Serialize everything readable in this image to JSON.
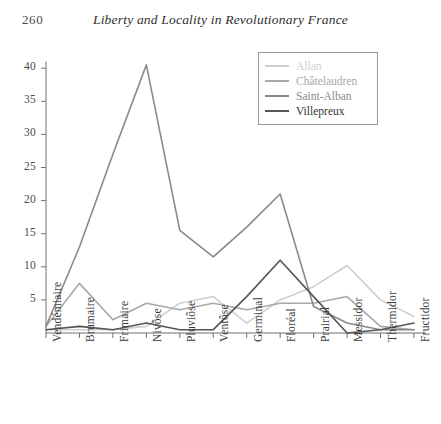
{
  "header": {
    "page_number": "260",
    "title": "Liberty and Locality in Revolutionary France"
  },
  "chart_data": {
    "type": "line",
    "title": "",
    "xlabel": "",
    "ylabel": "",
    "grid": false,
    "legend_position": "top-right",
    "categories": [
      "Vendémiaire",
      "Brumaire",
      "Frimaire",
      "Nivôse",
      "Pluviôse",
      "Ventôse",
      "Germinal",
      "Floréal",
      "Prairial",
      "Messidor",
      "Thermidor",
      "Fructidor"
    ],
    "ylim": [
      0,
      41
    ],
    "yticks": [
      5,
      10,
      15,
      20,
      25,
      30,
      35,
      40
    ],
    "ytick_labels": [
      "5",
      "10",
      "15",
      "20",
      "25",
      "30",
      "35",
      "40"
    ],
    "series": [
      {
        "name": "Allan",
        "color": "#cfcfcf",
        "width": 1.6,
        "values": [
          0.5,
          0.5,
          0.5,
          1.0,
          4.5,
          5.5,
          1.5,
          5.0,
          7.0,
          10.2,
          5.0,
          2.5
        ]
      },
      {
        "name": "Châtelaudren",
        "color": "#a8a8a8",
        "width": 1.6,
        "values": [
          1.0,
          7.5,
          2.0,
          4.5,
          3.5,
          4.5,
          3.5,
          4.5,
          4.5,
          5.5,
          1.0,
          0.5
        ]
      },
      {
        "name": "Saint-Alban",
        "color": "#8a8a8a",
        "width": 1.6,
        "values": [
          1.0,
          13.0,
          27.0,
          40.5,
          15.5,
          11.5,
          16.0,
          21.0,
          4.0,
          1.5,
          0.5,
          0.5
        ]
      },
      {
        "name": "Villepreux",
        "color": "#555555",
        "width": 1.6,
        "values": [
          0.5,
          1.0,
          0.5,
          1.5,
          0.5,
          0.5,
          5.5,
          11.0,
          5.5,
          0.0,
          0.5,
          1.5
        ]
      }
    ],
    "axis_color": "#6e6e6e"
  }
}
